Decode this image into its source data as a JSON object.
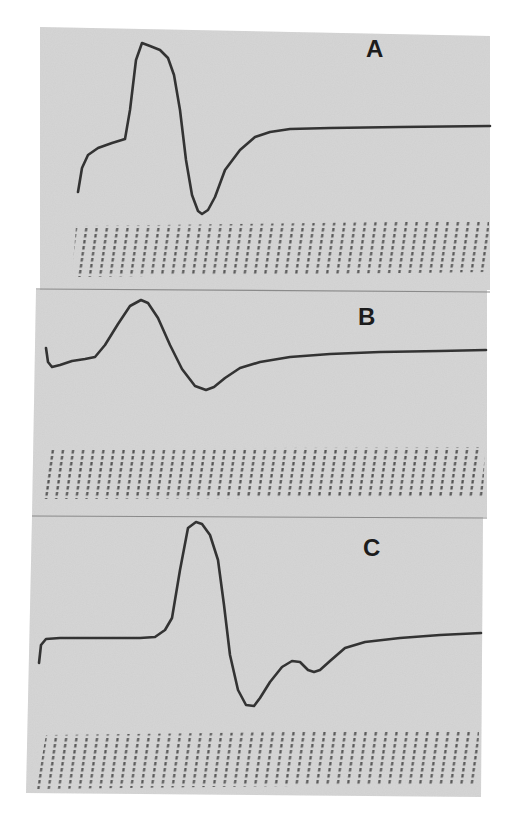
{
  "figure": {
    "colors": {
      "paper": "#d6d6d6",
      "paper_shade": "#c9c9c9",
      "trace": "#333333",
      "timing_marks": "#4a4a4a",
      "background": "#ffffff"
    },
    "panels": [
      {
        "id": "A",
        "label": "A"
      },
      {
        "id": "B",
        "label": "B"
      },
      {
        "id": "C",
        "label": "C"
      }
    ]
  },
  "chart_data": [
    {
      "type": "line",
      "title": "A",
      "xlabel": "",
      "ylabel": "",
      "grid": false,
      "units": "pixel coordinates (no axes/tick labels shown); timing marks below trace",
      "timing_marks": {
        "count": 40,
        "spacing_px": 10.3,
        "x_start": 80,
        "x_end": 488
      },
      "x": [
        78,
        82,
        88,
        98,
        112,
        125,
        130,
        136,
        142,
        150,
        160,
        168,
        174,
        180,
        186,
        192,
        198,
        202,
        208,
        215,
        225,
        240,
        255,
        270,
        290,
        330,
        400,
        490
      ],
      "y": [
        192,
        168,
        155,
        148,
        143,
        139,
        110,
        60,
        43,
        46,
        50,
        58,
        75,
        110,
        160,
        195,
        211,
        214,
        210,
        197,
        170,
        150,
        137,
        132,
        129,
        128,
        127,
        126
      ]
    },
    {
      "type": "line",
      "title": "B",
      "xlabel": "",
      "ylabel": "",
      "grid": false,
      "units": "pixel coordinates (no axes/tick labels shown); timing marks below trace",
      "timing_marks": {
        "count": 44,
        "spacing_px": 10.1,
        "x_start": 43,
        "x_end": 484
      },
      "x": [
        46,
        48,
        52,
        60,
        72,
        85,
        95,
        105,
        118,
        130,
        141,
        148,
        158,
        170,
        182,
        195,
        206,
        214,
        225,
        240,
        260,
        290,
        330,
        380,
        440,
        486
      ],
      "y": [
        348,
        362,
        367,
        365,
        361,
        359,
        357,
        345,
        324,
        306,
        300,
        303,
        318,
        345,
        369,
        386,
        390,
        387,
        378,
        368,
        362,
        357,
        354,
        352,
        351,
        350
      ]
    },
    {
      "type": "line",
      "title": "C",
      "xlabel": "",
      "ylabel": "",
      "grid": false,
      "units": "pixel coordinates (no axes/tick labels shown); timing marks below trace",
      "timing_marks": {
        "count": 43,
        "spacing_px": 10.3,
        "x_start": 45,
        "x_end": 478
      },
      "x": [
        39,
        41,
        46,
        60,
        100,
        140,
        155,
        165,
        172,
        180,
        188,
        196,
        202,
        210,
        218,
        224,
        230,
        238,
        246,
        254,
        260,
        270,
        282,
        292,
        300,
        308,
        314,
        320,
        330,
        345,
        365,
        400,
        440,
        481
      ],
      "y": [
        663,
        645,
        639,
        638,
        638,
        638,
        637,
        630,
        618,
        570,
        528,
        522,
        524,
        535,
        560,
        605,
        655,
        690,
        705,
        706,
        698,
        682,
        667,
        661,
        662,
        670,
        672,
        670,
        661,
        648,
        642,
        638,
        635,
        633
      ]
    }
  ]
}
